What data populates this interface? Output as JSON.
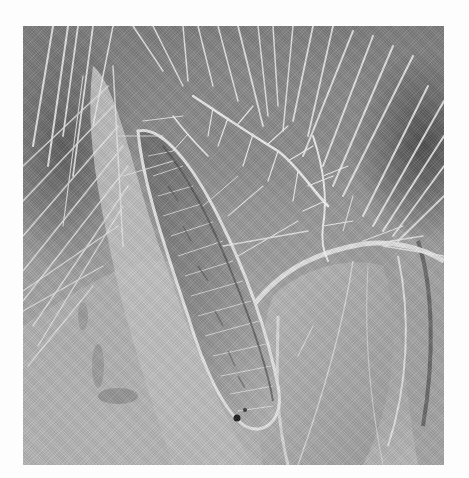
{
  "figure": {
    "type": "scanning electron micrograph",
    "color_mode": "grayscale",
    "frame": {
      "x": 23,
      "y": 26,
      "width": 421,
      "height": 439
    },
    "background_color": "#ffffff",
    "tones": {
      "dark": "#4e4e4e",
      "mid": "#9a9a9a",
      "light": "#d8d8d8",
      "highlight": "#f2f2f2"
    },
    "visible_text": [],
    "scale_bar": null
  },
  "regions": [
    {
      "name": "dense-setae-top",
      "description": "Many long straight hairs radiating from the upper edge"
    },
    {
      "name": "plumose-setae",
      "description": "Branched feather-like hairs in the upper middle"
    },
    {
      "name": "hair-lined-groove",
      "description": "Elongated diagonal groove filled with fine fibrous hairs, with a small dark pit near its lower end"
    },
    {
      "name": "curved-plates-right",
      "description": "Smooth curved shell-like plates along the right side"
    },
    {
      "name": "smooth-cuticle-lower-left",
      "description": "Lighter textured cuticle with darker blotches in the lower left"
    }
  ]
}
